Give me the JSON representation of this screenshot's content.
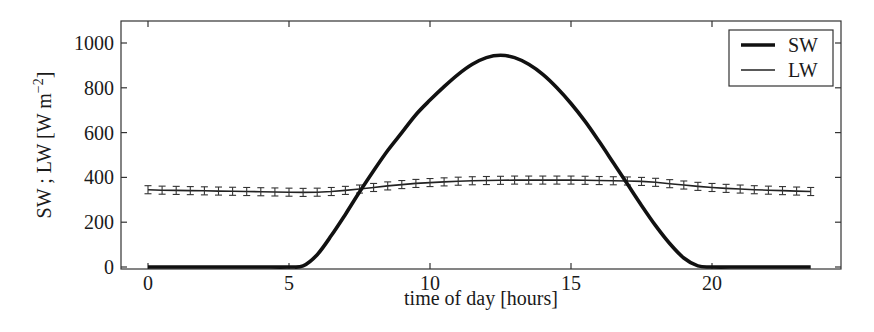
{
  "chart_data": {
    "type": "line",
    "title": "",
    "xlabel": "time of day [hours]",
    "ylabel": "SW ; LW [W m",
    "ylabel_sup": "−2",
    "ylabel_close": "]",
    "xlim": [
      -1,
      24.5
    ],
    "ylim": [
      0,
      1100
    ],
    "xticks": [
      0,
      5,
      10,
      15,
      20
    ],
    "yticks": [
      0,
      200,
      400,
      600,
      800,
      1000
    ],
    "grid": false,
    "legend": {
      "position": "upper right",
      "entries": [
        "SW",
        "LW"
      ]
    },
    "series": [
      {
        "name": "SW",
        "style": "thick-line",
        "x": [
          0,
          1,
          2,
          3,
          4,
          5,
          5.5,
          6,
          6.5,
          7,
          7.5,
          8,
          8.5,
          9,
          9.5,
          10,
          10.5,
          11,
          11.5,
          12,
          12.5,
          13,
          13.5,
          14,
          14.5,
          15,
          15.5,
          16,
          16.5,
          17,
          17.5,
          18,
          18.5,
          19,
          19.5,
          20,
          21,
          22,
          23,
          23.5
        ],
        "y": [
          0,
          0,
          0,
          0,
          0,
          0,
          5,
          55,
          140,
          235,
          335,
          430,
          520,
          600,
          680,
          745,
          805,
          860,
          905,
          935,
          945,
          935,
          905,
          860,
          800,
          730,
          650,
          560,
          465,
          370,
          275,
          185,
          105,
          40,
          5,
          0,
          0,
          0,
          0,
          0
        ]
      },
      {
        "name": "LW",
        "style": "thin-line-errorbars",
        "x": [
          0,
          0.5,
          1,
          1.5,
          2,
          2.5,
          3,
          3.5,
          4,
          4.5,
          5,
          5.5,
          6,
          6.5,
          7,
          7.5,
          8,
          8.5,
          9,
          9.5,
          10,
          10.5,
          11,
          11.5,
          12,
          12.5,
          13,
          13.5,
          14,
          14.5,
          15,
          15.5,
          16,
          16.5,
          17,
          17.5,
          18,
          18.5,
          19,
          19.5,
          20,
          20.5,
          21,
          21.5,
          22,
          22.5,
          23,
          23.5
        ],
        "y": [
          345,
          343,
          342,
          341,
          340,
          339,
          338,
          337,
          336,
          335,
          334,
          333,
          334,
          337,
          342,
          348,
          355,
          362,
          368,
          373,
          377,
          380,
          383,
          385,
          386,
          387,
          388,
          388,
          388,
          388,
          388,
          387,
          386,
          385,
          384,
          382,
          378,
          372,
          366,
          360,
          355,
          351,
          348,
          345,
          343,
          341,
          339,
          337
        ],
        "error": 18
      }
    ]
  }
}
